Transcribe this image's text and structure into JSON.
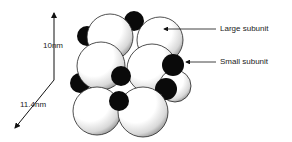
{
  "diagram": {
    "type": "molecular-structure",
    "dimensions": {
      "height_label": "10nm",
      "depth_label": "11.4nm"
    },
    "labels": {
      "large": "Large subunit",
      "small": "Small subunit"
    },
    "colors": {
      "large_fill": "#ffffff",
      "large_stroke": "#222222",
      "small_fill": "#0a0a0a",
      "shading": "#555555"
    }
  }
}
